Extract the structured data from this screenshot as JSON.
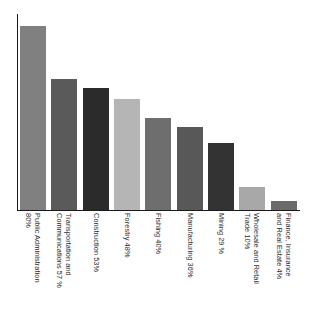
{
  "chart_data": {
    "type": "bar",
    "title": "",
    "subtitle": "",
    "xlabel": "",
    "ylabel": "",
    "ylim": [
      0,
      85
    ],
    "grid": false,
    "legend": false,
    "orientation": "vertical",
    "value_in_label": true,
    "categories": [
      "Public Administration",
      "Transportation and Communications",
      "Construction",
      "Forestry",
      "Fishing",
      "Manufacturing",
      "Mining",
      "Wholesale and Retail Trade",
      "Finance, Insurance and Real Estate"
    ],
    "values": [
      80,
      57,
      53,
      48,
      40,
      36,
      29,
      10,
      4
    ],
    "tick_labels": [
      {
        "line1": "Public Administration",
        "line2": "80%"
      },
      {
        "line1": "Transportation and",
        "line2": "Communications 57 %"
      },
      {
        "line1": "Construction 53%",
        "line2": ""
      },
      {
        "line1": "Forestry 48%",
        "line2": ""
      },
      {
        "line1": "Fishing 40%",
        "line2": ""
      },
      {
        "line1": "Manufacturing 36%",
        "line2": ""
      },
      {
        "line1": "Mining 29 %",
        "line2": ""
      },
      {
        "line1": "Wholesale and Retail",
        "line2": "Trade 10%"
      },
      {
        "line1": "Finance, Insurance",
        "line2": "and Real Estate 4%"
      }
    ],
    "bar_colors": [
      "#808080",
      "#5a5a5a",
      "#2b2b2b",
      "#b5b5b5",
      "#6e6e6e",
      "#585858",
      "#333333",
      "#a8a8a8",
      "#6b6b6b"
    ],
    "axis_color": "#1a1a1a",
    "background_color": "#ffffff"
  }
}
